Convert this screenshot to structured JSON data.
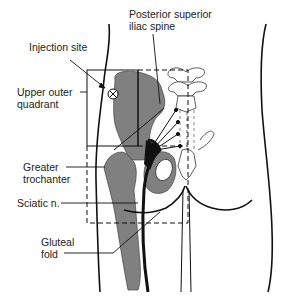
{
  "figure": {
    "colors": {
      "bone_fill": "#808080",
      "line": "#111111",
      "background": "#ffffff"
    }
  },
  "labels": {
    "psis_line1": "Posterior superior",
    "psis_line2": "iliac spine",
    "injection_site": "Injection site",
    "upper_outer_line1": "Upper outer",
    "upper_outer_line2": "quadrant",
    "greater_trochanter_line1": "Greater",
    "greater_trochanter_line2": "trochanter",
    "sciatic": "Sciatic n.",
    "gluteal_line1": "Gluteal",
    "gluteal_line2": "fold"
  },
  "symbols": {
    "injection_marker": "circled-x-icon"
  }
}
